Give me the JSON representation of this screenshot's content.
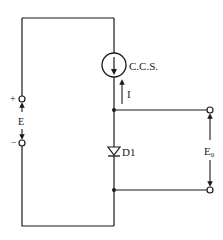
{
  "diagram": {
    "type": "circuit",
    "colors": {
      "wire": "#1a1a1a",
      "background": "#ffffff"
    },
    "components": {
      "current_source": {
        "label": "C.C.S.",
        "arrow_direction": "down"
      },
      "current": {
        "label": "I",
        "arrow_direction": "up"
      },
      "diode": {
        "label": "D1",
        "orientation": "cathode-down"
      },
      "supply": {
        "label": "E",
        "plus": "+",
        "minus": "−"
      },
      "output": {
        "label": "E",
        "subscript": "0"
      }
    }
  }
}
